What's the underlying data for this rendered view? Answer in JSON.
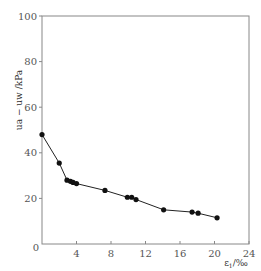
{
  "chart_data": {
    "type": "line",
    "title": "",
    "xlabel": "ε1/‰",
    "ylabel": "ua−uw/kPa",
    "xlim": [
      0,
      24
    ],
    "ylim": [
      0,
      100
    ],
    "xticks": [
      0,
      4,
      8,
      12,
      16,
      20,
      24
    ],
    "yticks": [
      20,
      40,
      60,
      80,
      100
    ],
    "grid": false,
    "legend": null,
    "series": [
      {
        "name": "ua-uw vs ε1",
        "x": [
          0.0,
          2.0,
          2.9,
          3.3,
          3.6,
          4.0,
          7.3,
          9.9,
          10.4,
          10.9,
          14.1,
          17.4,
          18.1,
          20.3
        ],
        "y": [
          48,
          35.5,
          28,
          27.5,
          27,
          26.5,
          23.5,
          20.5,
          20.5,
          19.5,
          15,
          14,
          13.5,
          11.5
        ]
      }
    ]
  },
  "axes": {
    "x_label_main": "ε",
    "x_label_sub": "1",
    "x_label_unit": "/‰",
    "y_label": "ua − uw /kPa",
    "origin_label": "0"
  }
}
